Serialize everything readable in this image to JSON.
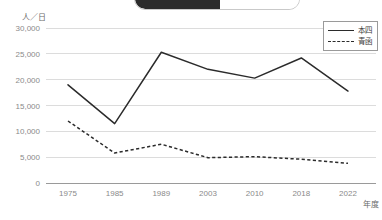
{
  "top_control": {
    "active_label": "",
    "inactive_label": ""
  },
  "legend": {
    "items": [
      {
        "label": "本四",
        "style": "solid"
      },
      {
        "label": "青函",
        "style": "dashed"
      }
    ]
  },
  "axes": {
    "y_unit": "人／日",
    "x_unit": "年度",
    "y_ticks": [
      "0",
      "5,000",
      "10,000",
      "15,000",
      "20,000",
      "25,000",
      "30,000"
    ],
    "x_ticks": [
      "1975",
      "1985",
      "1989",
      "2003",
      "2010",
      "2018",
      "2022"
    ]
  },
  "chart_data": {
    "type": "line",
    "title": "",
    "xlabel": "年度",
    "ylabel": "人／日",
    "categories": [
      "1975",
      "1985",
      "1989",
      "2003",
      "2010",
      "2018",
      "2022"
    ],
    "series": [
      {
        "name": "本四",
        "style": "solid",
        "values": [
          19000,
          11500,
          25300,
          22000,
          20300,
          24200,
          17800
        ]
      },
      {
        "name": "青函",
        "style": "dashed",
        "values": [
          12000,
          5800,
          7500,
          4900,
          5100,
          4600,
          3800
        ]
      }
    ],
    "ylim": [
      0,
      30000
    ],
    "ytick_values": [
      0,
      5000,
      10000,
      15000,
      20000,
      25000,
      30000
    ],
    "grid": true,
    "legend_position": "top-right"
  }
}
